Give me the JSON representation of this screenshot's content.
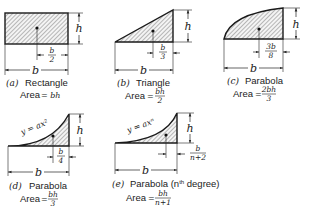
{
  "figures": [
    {
      "id": "a",
      "letter": "(a)",
      "name": "Rectangle",
      "area_label": "Area",
      "area_formula": "= bh",
      "height_label": "h",
      "base_label": "b",
      "centroid_offset": {
        "numerator": "b",
        "denominator": "2"
      }
    },
    {
      "id": "b",
      "letter": "(b)",
      "name": "Triangle",
      "area_label": "Area",
      "area_formula": {
        "prefix": "=",
        "numerator": "bh",
        "denominator": "2"
      },
      "height_label": "h",
      "base_label": "b",
      "centroid_offset": {
        "numerator": "b",
        "denominator": "3"
      }
    },
    {
      "id": "c",
      "letter": "(c)",
      "name": "Parabola",
      "area_label": "Area",
      "area_formula": {
        "prefix": "=",
        "numerator": "2bh",
        "denominator": "3"
      },
      "height_label": "h",
      "base_label": "b",
      "centroid_offset": {
        "numerator": "3b",
        "denominator": "8"
      }
    },
    {
      "id": "d",
      "letter": "(d)",
      "name": "Parabola",
      "curve_equation": "y = ax²",
      "area_label": "Area",
      "area_formula": {
        "prefix": "=",
        "numerator": "bh",
        "denominator": "3"
      },
      "height_label": "h",
      "base_label": "b",
      "centroid_offset": {
        "numerator": "b",
        "denominator": "4"
      }
    },
    {
      "id": "e",
      "letter": "(e)",
      "name": "Parabola (n",
      "name_sup": "th",
      "name_suffix": " degree)",
      "curve_equation": "y = axⁿ",
      "area_label": "Area",
      "area_formula": {
        "prefix": "=",
        "numerator": "bh",
        "denominator": "n+1"
      },
      "height_label": "h",
      "base_label": "b",
      "centroid_offset": {
        "numerator": "b",
        "denominator": "n+2"
      }
    }
  ],
  "colors": {
    "ink": "#1a1a1a",
    "hatch": "#555555",
    "background": "#ffffff"
  }
}
